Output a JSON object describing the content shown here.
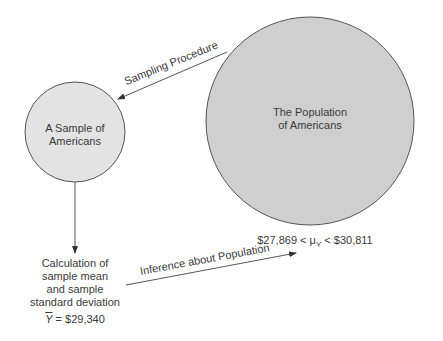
{
  "diagram": {
    "nodes": {
      "population": {
        "line1": "The Population",
        "line2": "of Americans",
        "fill": "#cfcfcf"
      },
      "sample": {
        "line1": "A Sample of",
        "line2": "Americans",
        "fill": "#e2e2e2"
      },
      "calculation": {
        "line1": "Calculation of",
        "line2": "sample mean",
        "line3": "and sample",
        "line4": "standard deviation"
      }
    },
    "edges": {
      "sampling": {
        "label": "Sampling Procedure"
      },
      "inference": {
        "label": "Inference about Population"
      }
    },
    "sample_mean": {
      "symbol": "Y",
      "equals": " = $29,340"
    },
    "confidence_interval": {
      "lower": "$27,869 < ",
      "mu": "μ",
      "mu_sub": "Y",
      "upper": " < $30,811"
    },
    "colors": {
      "stroke": "#4a4a4a",
      "text": "#3a3a3a"
    }
  }
}
